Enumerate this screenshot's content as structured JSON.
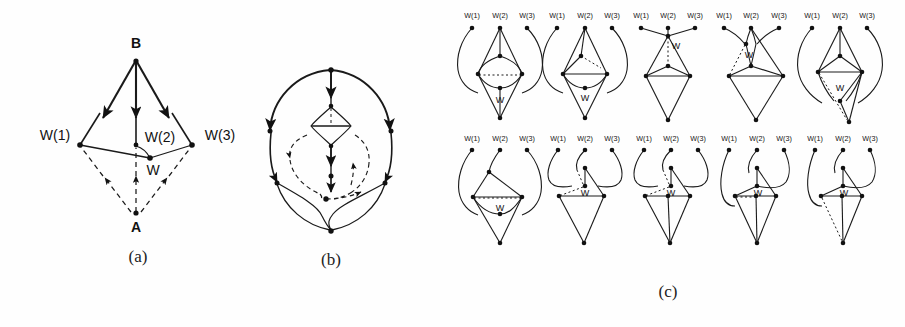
{
  "figure": {
    "title": "",
    "background_color": "#fefefe",
    "ink_color": "#111111",
    "width": 905,
    "height": 327
  },
  "panels": [
    {
      "id": "a",
      "caption": "(a)",
      "description": "Directed graph with apex B on top and apex A on bottom; three middle nodes W(1), W(2), W(3) and an interior node W.",
      "node_labels": {
        "top": "B",
        "bottom": "A",
        "left": "W(1)",
        "middle": "W(2)",
        "right": "W(3)",
        "inner": "W"
      },
      "solid_edges": "arrows from B to W(1), W(2), W(3)",
      "dashed_edges": "arrows from A to W(1), W, W(3)"
    },
    {
      "id": "b",
      "caption": "(b)",
      "description": "Planar embedding of the same directed graph drawn as an egg-shaped outline with solid and dashed directed arcs and a small central diamond."
    },
    {
      "id": "c",
      "caption": "(c)",
      "description": "Ten small undirected graph variants arranged in two rows of five. Each variant has three top terminals W(1), W(2), W(3), an internal vertex labelled W, and a bottom apex.",
      "rows": [
        {
          "row": 1,
          "variants": [
            {
              "index": 1,
              "terminals": [
                "W(1)",
                "W(2)",
                "W(3)"
              ],
              "inner_label": "W",
              "dotted_edge": "horizontal between left and right middle vertices"
            },
            {
              "index": 2,
              "terminals": [
                "W(1)",
                "W(2)",
                "W(3)"
              ],
              "inner_label": "W",
              "dotted_edge": "short diagonal near right middle vertex"
            },
            {
              "index": 3,
              "terminals": [
                "W(1)",
                "W(2)",
                "W(3)"
              ],
              "inner_label": "W",
              "dotted_edge": "vertical from top apex down to inner vertex"
            },
            {
              "index": 4,
              "terminals": [
                "W(1)",
                "W(2)",
                "W(3)"
              ],
              "inner_label": "W",
              "dotted_edge": "diagonal from inner vertex to left middle vertex"
            },
            {
              "index": 5,
              "terminals": [
                "W(1)",
                "W(2)",
                "W(3)"
              ],
              "inner_label": "W",
              "dotted_edge": "diagonal from left middle vertex down to bottom apex"
            }
          ]
        },
        {
          "row": 2,
          "variants": [
            {
              "index": 6,
              "terminals": [
                "W(1)",
                "W(2)",
                "W(3)"
              ],
              "inner_label": "W",
              "dotted_edge": "horizontal between left and right middle vertices"
            },
            {
              "index": 7,
              "terminals": [
                "W(1)",
                "W(2)",
                "W(3)"
              ],
              "inner_label": "W",
              "dotted_edge": "diagonal from inner vertex to left middle vertex"
            },
            {
              "index": 8,
              "terminals": [
                "W(1)",
                "W(2)",
                "W(3)"
              ],
              "inner_label": "W",
              "dotted_edge": "diagonal from inner vertex to left middle vertex"
            },
            {
              "index": 9,
              "terminals": [
                "W(1)",
                "W(2)",
                "W(3)"
              ],
              "inner_label": "W",
              "dotted_edge": "short horizontal left of inner vertex"
            },
            {
              "index": 10,
              "terminals": [
                "W(1)",
                "W(2)",
                "W(3)"
              ],
              "inner_label": "W",
              "dotted_edge": "diagonal from left middle vertex to bottom apex"
            }
          ]
        }
      ]
    }
  ],
  "captions": {
    "a": "(a)",
    "b": "(b)",
    "c": "(c)"
  },
  "labels": {
    "B": "B",
    "A": "A",
    "W1": "W(1)",
    "W2": "W(2)",
    "W3": "W(3)",
    "W": "W"
  }
}
